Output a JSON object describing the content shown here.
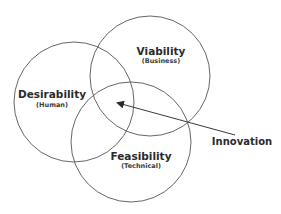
{
  "diagram": {
    "type": "venn",
    "stroke_color": "#555555",
    "circles": [
      {
        "id": "desirability",
        "title": "Desirability",
        "subtitle": "(Human)",
        "cx": 74,
        "cy": 102,
        "r": 60,
        "title_x": 52,
        "title_y": 98,
        "sub_x": 52,
        "sub_y": 107
      },
      {
        "id": "viability",
        "title": "Viability",
        "subtitle": "(Business)",
        "cx": 150,
        "cy": 76,
        "r": 60,
        "title_x": 161,
        "title_y": 55,
        "sub_x": 161,
        "sub_y": 63
      },
      {
        "id": "feasibility",
        "title": "Feasibility",
        "subtitle": "(Technical)",
        "cx": 131,
        "cy": 142,
        "r": 60,
        "title_x": 141,
        "title_y": 160,
        "sub_x": 141,
        "sub_y": 168
      }
    ],
    "arrow": {
      "label": "Innovation",
      "from": [
        235,
        135
      ],
      "to": [
        118,
        103
      ],
      "label_x": 242,
      "label_y": 145
    }
  }
}
